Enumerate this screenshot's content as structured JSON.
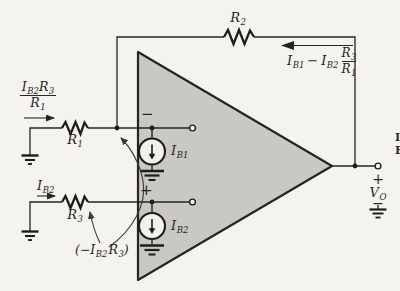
{
  "colors": {
    "background": "#f5f3ef",
    "ink": "#262524",
    "opamp_fill": "#c9c8c4"
  },
  "opamp": {
    "inverting_sign": "−",
    "noninverting_sign": "+"
  },
  "resistors": {
    "r1": {
      "name": "R",
      "sub": "1"
    },
    "r2": {
      "name": "R",
      "sub": "2"
    },
    "r3": {
      "name": "R",
      "sub": "3"
    }
  },
  "sources": {
    "ib1": {
      "name": "I",
      "sub": "B1"
    },
    "ib2": {
      "name": "I",
      "sub": "B2"
    }
  },
  "input_labels": {
    "fraction": {
      "num_i": "I",
      "num_i_sub": "B2",
      "num_r": "R",
      "num_r_sub": "3",
      "den_r": "R",
      "den_r_sub": "1"
    },
    "ib2_current": {
      "name": "I",
      "sub": "B2"
    },
    "offset": {
      "prefix": "(−",
      "i": "I",
      "i_sub": "B2",
      "r": "R",
      "r_sub": "3",
      "suffix": ")"
    }
  },
  "feedback_label": {
    "i1": "I",
    "i1_sub": "B1",
    "op": "−",
    "i2": "I",
    "i2_sub": "B2",
    "num_r": "R",
    "num_r_sub": "3",
    "den_r": "R",
    "den_r_sub": "1"
  },
  "output": {
    "plus": "+",
    "v": "V",
    "v_sub": "O",
    "minus": "−"
  },
  "edge_text": {
    "top": "I",
    "bottom": "E"
  }
}
